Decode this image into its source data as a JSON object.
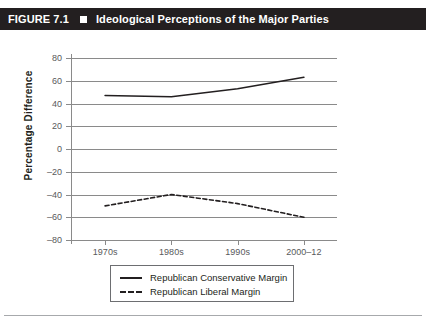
{
  "header": {
    "figure_label": "FIGURE 7.1",
    "bullet_icon": "square-bullet-icon",
    "title": "Ideological Perceptions of the Major Parties",
    "background_color": "#231f20",
    "text_color": "#ffffff"
  },
  "chart_data": {
    "type": "line",
    "title": "Ideological Perceptions of the Major Parties",
    "xlabel": "",
    "ylabel": "Percentage Difference",
    "categories": [
      "1970s",
      "1980s",
      "1990s",
      "2000–12"
    ],
    "ylim": [
      -80,
      80
    ],
    "yticks": [
      80,
      60,
      40,
      20,
      0,
      -20,
      -40,
      -60,
      -80
    ],
    "ytick_labels": [
      "80",
      "60",
      "40",
      "20",
      "0",
      "–20",
      "–40",
      "–60",
      "–80"
    ],
    "grid": true,
    "grid_axis": "y",
    "legend_position": "below-plot",
    "series": [
      {
        "name": "Republican Conservative Margin",
        "style": "solid",
        "color": "#231f20",
        "values": [
          47,
          46,
          53,
          63
        ]
      },
      {
        "name": "Republican Liberal Margin",
        "style": "dashed",
        "color": "#231f20",
        "values": [
          -50,
          -40,
          -48,
          -60
        ]
      }
    ]
  },
  "legend": {
    "items": [
      {
        "label": "Republican Conservative Margin",
        "style": "solid"
      },
      {
        "label": "Republican Liberal Margin",
        "style": "dashed"
      }
    ]
  }
}
